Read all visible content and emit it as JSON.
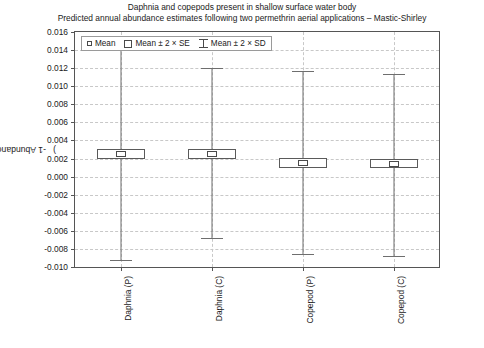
{
  "figure": {
    "title_line1": "Daphnia and copepods present in shallow surface water body",
    "title_line2": "Predicted annual abundance estimates following two permethrin aerial applications – Mastic-Shirley"
  },
  "legend": {
    "position": "top-left-inside",
    "entries": [
      {
        "symbol": "small-open-square",
        "label": "Mean"
      },
      {
        "symbol": "open-rectangle",
        "label": "Mean ± 2 × SE"
      },
      {
        "symbol": "i-beam-whisker",
        "label": "Mean ± 2 × SD"
      }
    ]
  },
  "axes": {
    "ylabel_main": "Abundance (mg l",
    "ylabel_sup": "-1",
    "ylabel_close": ")",
    "ylabel_full": "Abundance (mg l⁻¹)",
    "yticks": [
      "0.016",
      "0.014",
      "0.012",
      "0.010",
      "0.008",
      "0.006",
      "0.004",
      "0.002",
      "0.000",
      "-0.002",
      "-0.004",
      "-0.006",
      "-0.008",
      "-0.010"
    ],
    "ytick_values": [
      0.016,
      0.014,
      0.012,
      0.01,
      0.008,
      0.006,
      0.004,
      0.002,
      0.0,
      -0.002,
      -0.004,
      -0.006,
      -0.008,
      -0.01
    ],
    "ylim": [
      -0.01,
      0.016
    ],
    "xlabel": ""
  },
  "chart_data": {
    "type": "box",
    "title": "Daphnia and copepods present in shallow surface water body",
    "subtitle": "Predicted annual abundance estimates following two permethrin aerial applications – Mastic-Shirley",
    "xlabel": "",
    "ylabel": "Abundance (mg l⁻¹)",
    "ylim": [
      -0.01,
      0.016
    ],
    "grid": true,
    "legend_position": "upper left",
    "categories": [
      "Daphnia (P)",
      "Daphnia (C)",
      "Copepod (P)",
      "Copepod (C)"
    ],
    "series": [
      {
        "name": "Mean",
        "values": [
          0.0025,
          0.0025,
          0.0015,
          0.0014
        ]
      },
      {
        "name": "Mean - 2 x SE",
        "values": [
          0.002,
          0.002,
          0.001,
          0.0009
        ]
      },
      {
        "name": "Mean + 2 x SE",
        "values": [
          0.0031,
          0.0031,
          0.0021,
          0.002
        ]
      },
      {
        "name": "Mean - 2 x SD",
        "values": [
          -0.0092,
          -0.0068,
          -0.0086,
          -0.0088
        ]
      },
      {
        "name": "Mean + 2 x SD",
        "values": [
          0.0142,
          0.012,
          0.0117,
          0.0114
        ]
      }
    ],
    "points": [
      {
        "category": "Daphnia (P)",
        "mean": 0.0025,
        "se_low": 0.002,
        "se_high": 0.0031,
        "sd_low": -0.0092,
        "sd_high": 0.0142
      },
      {
        "category": "Daphnia (C)",
        "mean": 0.0025,
        "se_low": 0.002,
        "se_high": 0.0031,
        "sd_low": -0.0068,
        "sd_high": 0.012
      },
      {
        "category": "Copepod (P)",
        "mean": 0.0015,
        "se_low": 0.001,
        "se_high": 0.0021,
        "sd_low": -0.0086,
        "sd_high": 0.0117
      },
      {
        "category": "Copepod (C)",
        "mean": 0.0014,
        "se_low": 0.0009,
        "se_high": 0.002,
        "sd_low": -0.0088,
        "sd_high": 0.0114
      }
    ]
  }
}
